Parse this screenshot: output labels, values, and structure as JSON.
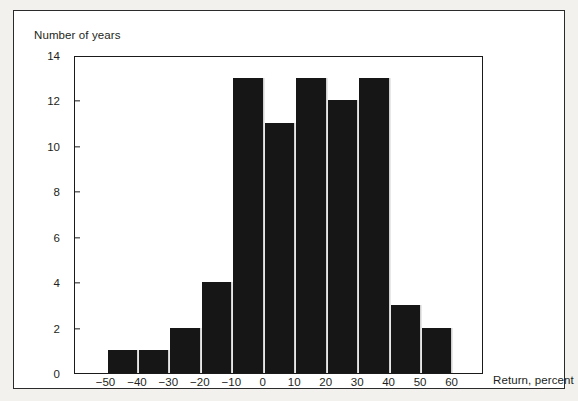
{
  "figure": {
    "y_axis_caption": "Number of years",
    "x_axis_caption": "Return, percent"
  },
  "chart_data": {
    "type": "bar",
    "title": "",
    "subtitle": "",
    "xlabel": "Return, percent",
    "ylabel": "Number of years",
    "xlim": [
      -60,
      70
    ],
    "ylim": [
      0,
      14
    ],
    "grid": false,
    "legend": null,
    "bin_width": 10,
    "x_tick_labels": [
      "-50",
      "-40",
      "-30",
      "-20",
      "-10",
      "0",
      "10",
      "20",
      "30",
      "40",
      "50",
      "60"
    ],
    "x_tick_values": [
      -50,
      -40,
      -30,
      -20,
      -10,
      0,
      10,
      20,
      30,
      40,
      50,
      60
    ],
    "y_tick_labels": [
      "0",
      "2",
      "4",
      "6",
      "8",
      "10",
      "12",
      "14"
    ],
    "y_tick_values": [
      0,
      2,
      4,
      6,
      8,
      10,
      12,
      14
    ],
    "categories": [
      "-50 to -40",
      "-40 to -30",
      "-30 to -20",
      "-20 to -10",
      "-10 to 0",
      "0 to 10",
      "10 to 20",
      "20 to 30",
      "30 to 40",
      "40 to 50",
      "50 to 60"
    ],
    "bin_starts": [
      -50,
      -40,
      -30,
      -20,
      -10,
      0,
      10,
      20,
      30,
      40,
      50
    ],
    "values": [
      1,
      1,
      2,
      4,
      13,
      11,
      13,
      12,
      13,
      3,
      2
    ],
    "bar_color": "#161616",
    "frame_color": "#1a1a1a",
    "text_color": "#231f20"
  }
}
